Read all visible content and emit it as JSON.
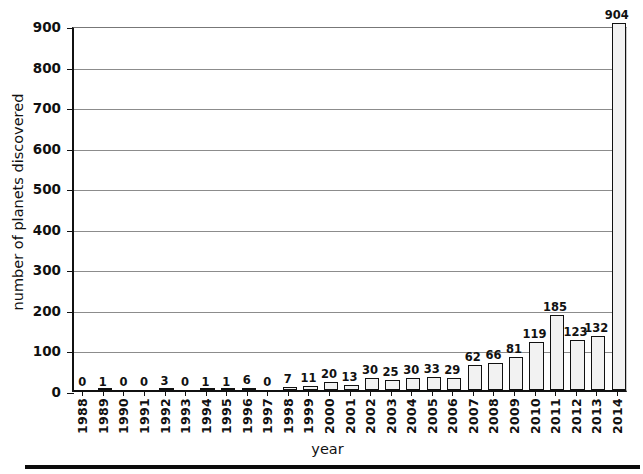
{
  "chart_data": {
    "type": "bar",
    "title": "",
    "xlabel": "year",
    "ylabel": "number of planets discovered",
    "ylim": [
      0,
      900
    ],
    "yticks": [
      0,
      100,
      200,
      300,
      400,
      500,
      600,
      700,
      800,
      900
    ],
    "grid": true,
    "legend": null,
    "categories": [
      "1988",
      "1989",
      "1990",
      "1991",
      "1992",
      "1993",
      "1994",
      "1995",
      "1996",
      "1997",
      "1998",
      "1999",
      "2000",
      "2001",
      "2002",
      "2003",
      "2004",
      "2005",
      "2006",
      "2007",
      "2008",
      "2009",
      "2010",
      "2011",
      "2012",
      "2013",
      "2014"
    ],
    "values": [
      0,
      1,
      0,
      0,
      3,
      0,
      1,
      1,
      6,
      0,
      7,
      11,
      20,
      13,
      30,
      25,
      30,
      33,
      29,
      62,
      66,
      81,
      119,
      185,
      123,
      132,
      904
    ],
    "value_labels": [
      "0",
      "1",
      "0",
      "0",
      "3",
      "0",
      "1",
      "1",
      "6",
      "0",
      "7",
      "11",
      "20",
      "13",
      "30",
      "25",
      "30",
      "33",
      "29",
      "62",
      "66",
      "81",
      "119",
      "185",
      "123",
      "132",
      "904"
    ]
  },
  "style": {
    "bar_fill": "#f2f2f2",
    "bar_edge": "#111111",
    "gridline_color": "#8c8c8c",
    "axis_color": "#111111",
    "background": "#ffffff"
  }
}
